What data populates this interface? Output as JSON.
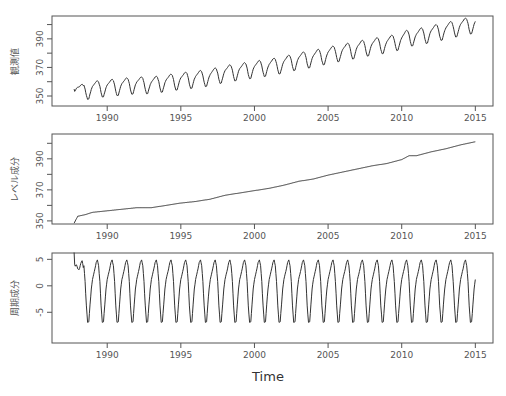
{
  "figure": {
    "x_title": "Time",
    "colors": {
      "line": "#333333",
      "frame": "#555555",
      "text": "#555555",
      "background": "#ffffff"
    }
  },
  "chart_data": [
    {
      "type": "line",
      "title": "",
      "panel": "observed",
      "ylabel": "観測値",
      "xlabel": "",
      "xlim": [
        1986.25,
        2016.2
      ],
      "ylim": [
        343,
        406
      ],
      "x_ticks": [
        1990,
        1995,
        2000,
        2005,
        2010,
        2015
      ],
      "y_ticks": [
        350,
        360,
        370,
        380,
        390,
        400
      ],
      "y_tick_labels": [
        "350",
        "",
        "370",
        "",
        "390",
        ""
      ],
      "x_start": 1987.75,
      "x_end": 2015.0,
      "description": "Monthly observed series = level + seasonal; rises from ~353 to ~400 with seasonal swings of about ±6",
      "grid": false
    },
    {
      "type": "line",
      "panel": "level",
      "ylabel": "レベル成分",
      "xlabel": "",
      "xlim": [
        1986.25,
        2016.2
      ],
      "ylim": [
        348,
        406
      ],
      "x_ticks": [
        1990,
        1995,
        2000,
        2005,
        2010,
        2015
      ],
      "y_ticks": [
        350,
        360,
        370,
        380,
        390,
        400
      ],
      "y_tick_labels": [
        "350",
        "",
        "370",
        "",
        "390",
        ""
      ],
      "x": [
        1987.75,
        1988.0,
        1988.5,
        1989,
        1990,
        1991,
        1992,
        1993,
        1994,
        1995,
        1996,
        1997,
        1998,
        1999,
        2000,
        2001,
        2002,
        2003,
        2004,
        2005,
        2006,
        2007,
        2008,
        2009,
        2010,
        2010.5,
        2011,
        2012,
        2013,
        2014,
        2014.5,
        2015.0
      ],
      "values": [
        348.5,
        353.0,
        354.0,
        355.5,
        356.5,
        357.5,
        358.5,
        358.5,
        360.0,
        361.5,
        362.5,
        364.0,
        366.5,
        368.0,
        369.5,
        371.0,
        373.0,
        375.5,
        377.0,
        379.5,
        381.5,
        383.5,
        385.5,
        387.0,
        389.5,
        392.0,
        392.0,
        394.5,
        396.5,
        399.0,
        400.0,
        401.0
      ],
      "grid": false
    },
    {
      "type": "line",
      "panel": "seasonal",
      "ylabel": "周期成分",
      "xlabel": "Time",
      "xlim": [
        1986.25,
        2016.2
      ],
      "ylim": [
        -10.8,
        6.2
      ],
      "x_ticks": [
        1990,
        1995,
        2000,
        2005,
        2010,
        2015
      ],
      "y_ticks": [
        5,
        0,
        -5
      ],
      "y_tick_labels": [
        "5",
        "0",
        "-5"
      ],
      "monthly_pattern_jan_to_dec": [
        1.2,
        2.2,
        3.2,
        4.4,
        4.9,
        3.8,
        0.8,
        -3.8,
        -6.9,
        -6.8,
        -3.6,
        -0.6
      ],
      "initial_transient": {
        "x": [
          1987.75,
          1987.8,
          1987.9,
          1988.0,
          1988.1,
          1988.2,
          1988.3,
          1988.4
        ],
        "values": [
          6.3,
          3.5,
          4.1,
          3.2,
          3.0,
          4.2,
          4.8,
          3.0
        ]
      },
      "grid": false
    }
  ]
}
